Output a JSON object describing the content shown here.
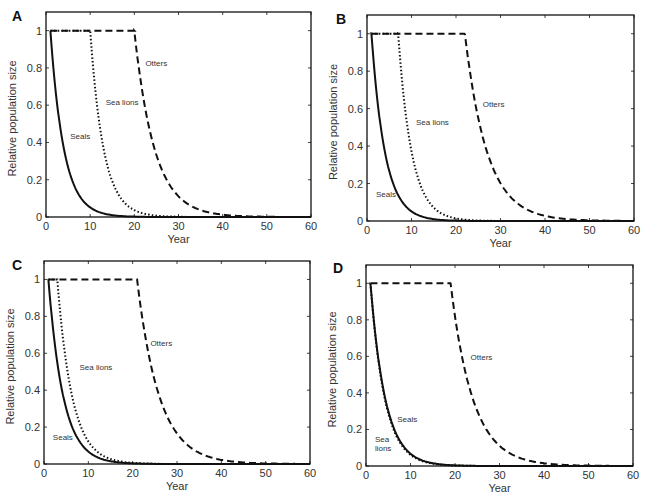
{
  "figure": {
    "panels": [
      "A",
      "B",
      "C",
      "D"
    ]
  },
  "chart_data": [
    {
      "panel": "A",
      "type": "line",
      "title": "",
      "xlabel": "Year",
      "ylabel": "Relative population size",
      "xlim": [
        0,
        60
      ],
      "ylim": [
        0,
        1.1
      ],
      "xticks": [
        0,
        10,
        20,
        30,
        40,
        50,
        60
      ],
      "yticks": [
        0,
        0.2,
        0.4,
        0.6,
        0.8,
        1
      ],
      "ytick_labels": [
        "0",
        "0.2",
        "0.4",
        "0.6",
        "0.8",
        "1"
      ],
      "grid": false,
      "legend": "inline labels",
      "series": [
        {
          "name": "Seals",
          "style": "solid",
          "decline_start_year": 1,
          "decay_rate": 0.33,
          "x": [
            0,
            1,
            2,
            3,
            4,
            5,
            6,
            8,
            10,
            12,
            15,
            20,
            25,
            30,
            40,
            60
          ],
          "values": [
            1,
            1,
            0.72,
            0.52,
            0.37,
            0.27,
            0.19,
            0.1,
            0.05,
            0.026,
            0.01,
            0.002,
            0,
            0,
            0,
            0
          ],
          "label_pos": {
            "year": 5.5,
            "y": 0.42
          }
        },
        {
          "name": "Sea lions",
          "style": "dotted",
          "decline_start_year": 10,
          "decay_rate": 0.33,
          "x": [
            0,
            10,
            11,
            12,
            13,
            14,
            15,
            17,
            19,
            21,
            24,
            28,
            35,
            60
          ],
          "values": [
            1,
            1,
            0.72,
            0.52,
            0.37,
            0.27,
            0.19,
            0.1,
            0.05,
            0.026,
            0.01,
            0.002,
            0,
            0
          ],
          "label_pos": {
            "year": 13.5,
            "y": 0.6
          }
        },
        {
          "name": "Otters",
          "style": "dashed",
          "decline_start_year": 20,
          "decay_rate": 0.22,
          "x": [
            0,
            20,
            21,
            22,
            23,
            24,
            25,
            27,
            29,
            31,
            34,
            38,
            45,
            60
          ],
          "values": [
            1,
            1,
            0.8,
            0.64,
            0.52,
            0.42,
            0.33,
            0.21,
            0.14,
            0.09,
            0.046,
            0.019,
            0.004,
            0
          ],
          "label_pos": {
            "year": 22.5,
            "y": 0.81
          }
        }
      ]
    },
    {
      "panel": "B",
      "type": "line",
      "title": "",
      "xlabel": "Year",
      "ylabel": "Relative population size",
      "xlim": [
        0,
        60
      ],
      "ylim": [
        0,
        1.1
      ],
      "xticks": [
        0,
        10,
        20,
        30,
        40,
        50,
        60
      ],
      "yticks": [
        0,
        0.2,
        0.4,
        0.6,
        0.8,
        1
      ],
      "ytick_labels": [
        "0",
        "0.2",
        "0.4",
        "0.6",
        "0.8",
        "1"
      ],
      "grid": false,
      "legend": "inline labels",
      "series": [
        {
          "name": "Seals",
          "style": "solid",
          "decline_start_year": 1,
          "decay_rate": 0.33,
          "label_pos": {
            "year": 2,
            "y": 0.13
          }
        },
        {
          "name": "Sea lions",
          "style": "dotted",
          "decline_start_year": 7,
          "decay_rate": 0.33,
          "label_pos": {
            "year": 11,
            "y": 0.51
          }
        },
        {
          "name": "Otters",
          "style": "dashed",
          "decline_start_year": 22,
          "decay_rate": 0.2,
          "label_pos": {
            "year": 26,
            "y": 0.61
          }
        }
      ]
    },
    {
      "panel": "C",
      "type": "line",
      "title": "",
      "xlabel": "Year",
      "ylabel": "Relative population size",
      "xlim": [
        0,
        60
      ],
      "ylim": [
        0,
        1.1
      ],
      "xticks": [
        0,
        10,
        20,
        30,
        40,
        50,
        60
      ],
      "yticks": [
        0,
        0.2,
        0.4,
        0.6,
        0.8,
        1
      ],
      "ytick_labels": [
        "0",
        "0.2",
        "0.4",
        "0.6",
        "0.8",
        "1"
      ],
      "grid": false,
      "legend": "inline labels",
      "series": [
        {
          "name": "Seals",
          "style": "solid",
          "decline_start_year": 1,
          "decay_rate": 0.3,
          "label_pos": {
            "year": 2,
            "y": 0.13
          }
        },
        {
          "name": "Sea lions",
          "style": "dotted",
          "decline_start_year": 3,
          "decay_rate": 0.3,
          "label_pos": {
            "year": 8,
            "y": 0.51
          }
        },
        {
          "name": "Otters",
          "style": "dashed",
          "decline_start_year": 21,
          "decay_rate": 0.2,
          "label_pos": {
            "year": 24,
            "y": 0.64
          }
        }
      ]
    },
    {
      "panel": "D",
      "type": "line",
      "title": "",
      "xlabel": "Year",
      "ylabel": "Relative population size",
      "xlim": [
        0,
        60
      ],
      "ylim": [
        0,
        1.1
      ],
      "xticks": [
        0,
        10,
        20,
        30,
        40,
        50,
        60
      ],
      "yticks": [
        0,
        0.2,
        0.4,
        0.6,
        0.8,
        1
      ],
      "ytick_labels": [
        "0",
        "0.2",
        "0.4",
        "0.6",
        "0.8",
        "1"
      ],
      "grid": false,
      "legend": "inline labels",
      "series": [
        {
          "name": "Seals",
          "style": "solid",
          "decline_start_year": 1,
          "decay_rate": 0.3,
          "label_pos": {
            "year": 7,
            "y": 0.24
          }
        },
        {
          "name": "Sea lions",
          "style": "dotted",
          "decline_start_year": 1,
          "decay_rate": 0.31,
          "label_lines": [
            "Sea",
            "lions"
          ],
          "label_pos": {
            "year": 2,
            "y": 0.13
          }
        },
        {
          "name": "Otters",
          "style": "dashed",
          "decline_start_year": 19,
          "decay_rate": 0.2,
          "label_pos": {
            "year": 23.5,
            "y": 0.58
          }
        }
      ]
    }
  ],
  "layout": {
    "panels": [
      {
        "letter_x": 12,
        "letter_y": 8,
        "plot": {
          "left": 46,
          "top": 12,
          "right": 311,
          "bottom": 217
        }
      },
      {
        "letter_x": 336,
        "letter_y": 11,
        "plot": {
          "left": 367,
          "top": 15,
          "right": 634,
          "bottom": 221
        }
      },
      {
        "letter_x": 12,
        "letter_y": 257,
        "plot": {
          "left": 44,
          "top": 261,
          "right": 310,
          "bottom": 464
        }
      },
      {
        "letter_x": 333,
        "letter_y": 260,
        "plot": {
          "left": 366,
          "top": 265,
          "right": 633,
          "bottom": 466
        }
      }
    ]
  }
}
